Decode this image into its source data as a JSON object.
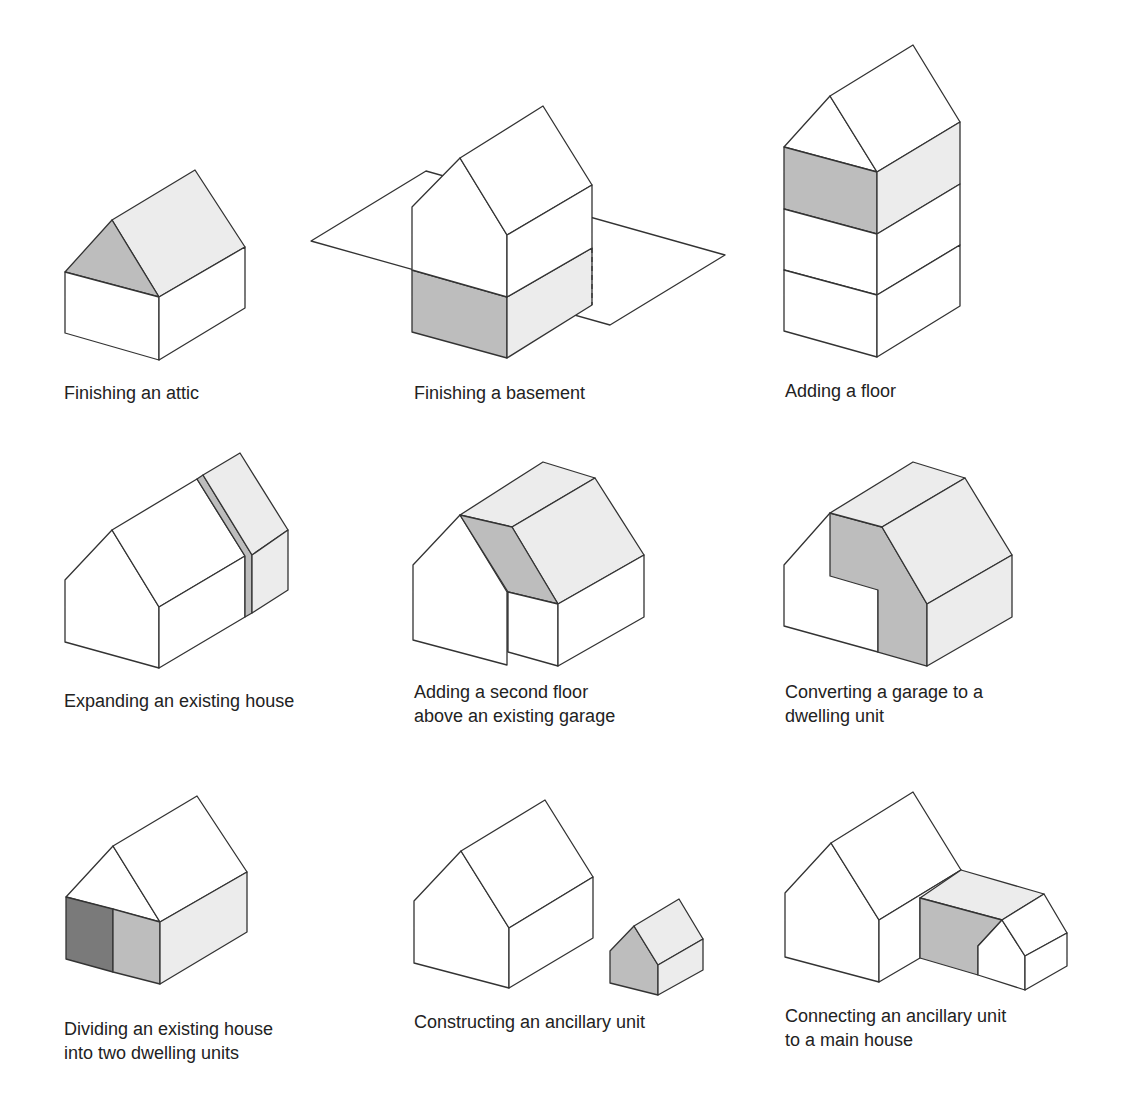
{
  "colors": {
    "line": "#333333",
    "background": "#ffffff",
    "light_shade": "#ececec",
    "medium_shade": "#bdbdbd",
    "dark_shade": "#7a7a7a"
  },
  "panels": [
    {
      "id": "attic",
      "caption": "Finishing an attic"
    },
    {
      "id": "basement",
      "caption": "Finishing a basement"
    },
    {
      "id": "floor",
      "caption": "Adding a floor"
    },
    {
      "id": "expand",
      "caption": "Expanding an existing house"
    },
    {
      "id": "garage-floor",
      "caption": "Adding a second floor\nabove an existing garage"
    },
    {
      "id": "garage-convert",
      "caption": "Converting a garage to a\ndwelling unit"
    },
    {
      "id": "divide",
      "caption": "Dividing an existing house\ninto two dwelling units"
    },
    {
      "id": "ancillary",
      "caption": "Constructing an ancillary unit"
    },
    {
      "id": "connect",
      "caption": "Connecting an ancillary unit\nto a main house"
    }
  ]
}
